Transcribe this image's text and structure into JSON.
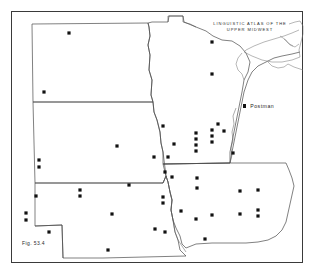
{
  "figure": {
    "title_line1": "LINGUISTIC  ATLAS  OF  THE",
    "title_line2": "UPPER  MIDWEST",
    "caption": "Fig. 53.4",
    "legend": {
      "marker_icon": "filled-square-dot",
      "label": "Postman"
    },
    "colors": {
      "frame": "#3a3a3a",
      "coastline": "#6f6f6f",
      "state_border": "#4a4a4a",
      "dot": "#111111",
      "background": "#ffffff"
    }
  },
  "chart_data": {
    "type": "scatter",
    "title": "LINGUISTIC ATLAS OF THE UPPER MIDWEST",
    "subtitle": "Fig. 53.4",
    "xlabel": "",
    "ylabel": "",
    "xlim": [
      0,
      314
    ],
    "ylim": [
      0,
      277
    ],
    "grid": false,
    "legend_position": "right-upper",
    "series": [
      {
        "name": "Postman",
        "marker": "filled-square",
        "marker_size_px": 3.2,
        "color": "#111111",
        "count": 47,
        "points": [
          {
            "x": 69,
            "y": 33,
            "region": "North Dakota"
          },
          {
            "x": 44,
            "y": 92,
            "region": "North Dakota"
          },
          {
            "x": 212,
            "y": 42,
            "region": "Minnesota"
          },
          {
            "x": 212,
            "y": 74,
            "region": "Minnesota"
          },
          {
            "x": 163,
            "y": 126,
            "region": "Minnesota"
          },
          {
            "x": 174,
            "y": 144,
            "region": "Minnesota"
          },
          {
            "x": 168,
            "y": 157,
            "region": "Minnesota"
          },
          {
            "x": 165,
            "y": 172,
            "region": "Minnesota"
          },
          {
            "x": 172,
            "y": 177,
            "region": "Minnesota"
          },
          {
            "x": 196,
            "y": 133,
            "region": "Minnesota"
          },
          {
            "x": 196,
            "y": 139,
            "region": "Minnesota"
          },
          {
            "x": 196,
            "y": 145,
            "region": "Minnesota"
          },
          {
            "x": 196,
            "y": 151,
            "region": "Minnesota"
          },
          {
            "x": 212,
            "y": 130,
            "region": "Minnesota"
          },
          {
            "x": 212,
            "y": 136,
            "region": "Minnesota"
          },
          {
            "x": 212,
            "y": 142,
            "region": "Minnesota"
          },
          {
            "x": 224,
            "y": 131,
            "region": "Minnesota"
          },
          {
            "x": 233,
            "y": 153,
            "region": "Minnesota"
          },
          {
            "x": 117,
            "y": 146,
            "region": "South Dakota"
          },
          {
            "x": 154,
            "y": 157,
            "region": "South Dakota"
          },
          {
            "x": 39,
            "y": 160,
            "region": "South Dakota"
          },
          {
            "x": 39,
            "y": 167,
            "region": "South Dakota"
          },
          {
            "x": 80,
            "y": 190,
            "region": "South Dakota"
          },
          {
            "x": 80,
            "y": 196,
            "region": "South Dakota"
          },
          {
            "x": 36,
            "y": 196,
            "region": "Nebraska"
          },
          {
            "x": 26,
            "y": 213,
            "region": "Nebraska"
          },
          {
            "x": 26,
            "y": 220,
            "region": "Nebraska"
          },
          {
            "x": 49,
            "y": 232,
            "region": "Nebraska"
          },
          {
            "x": 112,
            "y": 214,
            "region": "Nebraska"
          },
          {
            "x": 108,
            "y": 250,
            "region": "Nebraska"
          },
          {
            "x": 155,
            "y": 229,
            "region": "Nebraska"
          },
          {
            "x": 163,
            "y": 197,
            "region": "Nebraska"
          },
          {
            "x": 163,
            "y": 203,
            "region": "Nebraska"
          },
          {
            "x": 165,
            "y": 232,
            "region": "Iowa"
          },
          {
            "x": 197,
            "y": 178,
            "region": "Iowa"
          },
          {
            "x": 197,
            "y": 188,
            "region": "Iowa"
          },
          {
            "x": 196,
            "y": 219,
            "region": "Iowa"
          },
          {
            "x": 212,
            "y": 215,
            "region": "Iowa"
          },
          {
            "x": 205,
            "y": 239,
            "region": "Iowa"
          },
          {
            "x": 240,
            "y": 191,
            "region": "Iowa"
          },
          {
            "x": 240,
            "y": 214,
            "region": "Iowa"
          },
          {
            "x": 258,
            "y": 190,
            "region": "Iowa"
          },
          {
            "x": 258,
            "y": 210,
            "region": "Iowa"
          },
          {
            "x": 258,
            "y": 216,
            "region": "Iowa"
          },
          {
            "x": 218,
            "y": 124,
            "region": "Minnesota"
          },
          {
            "x": 181,
            "y": 211,
            "region": "Iowa"
          },
          {
            "x": 129,
            "y": 185,
            "region": "South Dakota"
          }
        ]
      }
    ]
  }
}
